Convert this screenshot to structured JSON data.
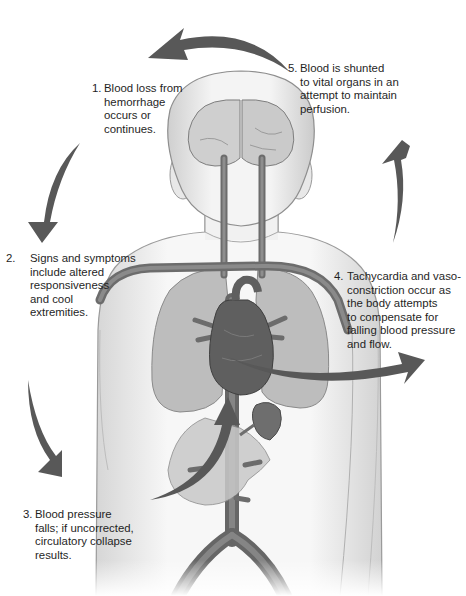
{
  "diagram": {
    "colors": {
      "arrow": "#585858",
      "skin": "#f1f1f1",
      "skin_outline": "#9a9a9a",
      "vessel": "#6e6e6e",
      "lung": "#bdbdbd",
      "heart": "#5f5f5f",
      "organ": "#c9c9c9",
      "brain": "#cfcfcf"
    },
    "steps": [
      {
        "num": "1.",
        "text": "Blood loss from\nhemorrhage\noccurs or\ncontinues."
      },
      {
        "num": "2.",
        "text": "Signs and symptoms\ninclude altered\nresponsiveness\nand cool\nextremities."
      },
      {
        "num": "3.",
        "text": "Blood pressure\nfalls; if uncorrected,\ncirculatory collapse\nresults."
      },
      {
        "num": "4.",
        "text": "Tachycardia and vaso-\nconstriction occur as\nthe body attempts\nto compensate for\nfalling blood pressure\nand flow."
      },
      {
        "num": "5.",
        "text": "Blood is shunted\nto vital organs in an\nattempt to maintain\nperfusion."
      }
    ],
    "icons": [
      "cycle-arrow-icon",
      "body-illustration",
      "brain-icon",
      "heart-icon",
      "lungs-icon",
      "kidney-icon"
    ]
  }
}
